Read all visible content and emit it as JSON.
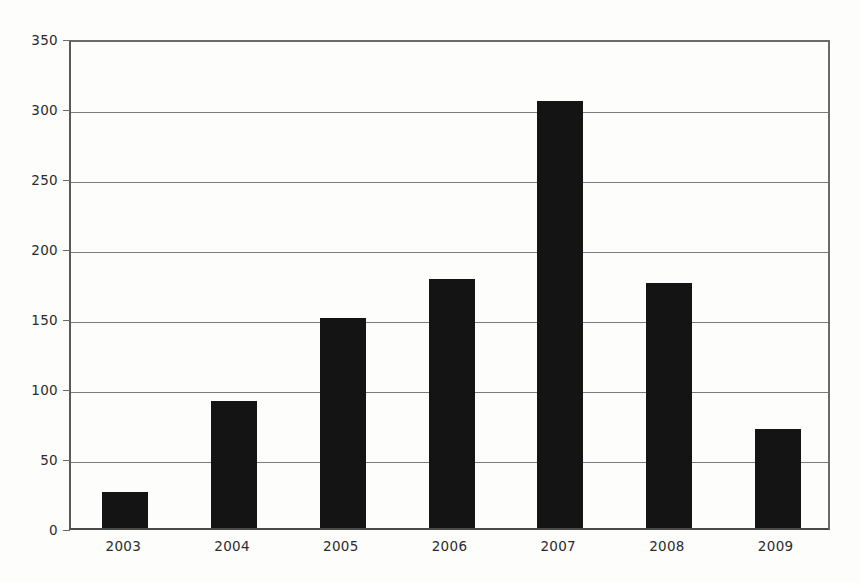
{
  "chart_data": {
    "type": "bar",
    "title": "",
    "subtitle": "",
    "xlabel": "",
    "ylabel": "",
    "categories": [
      "2003",
      "2004",
      "2005",
      "2006",
      "2007",
      "2008",
      "2009"
    ],
    "values": [
      26,
      91,
      150,
      178,
      305,
      175,
      71
    ],
    "ylim": [
      0,
      350
    ],
    "yticks": [
      0,
      50,
      100,
      150,
      200,
      250,
      300,
      350
    ],
    "ytick_labels": [
      "0",
      "50",
      "100",
      "150",
      "200",
      "250",
      "300",
      "350"
    ],
    "grid": true,
    "legend": null,
    "legend_position": "none",
    "bar_color": "#141414",
    "axis_color": "#5a5a5a",
    "gridline_color": "#7b7b7b",
    "background_color": "#fdfdfc"
  }
}
